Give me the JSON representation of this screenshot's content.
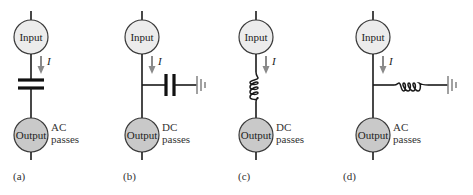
{
  "figure": {
    "panels": [
      {
        "id": "a",
        "label": "(a)",
        "input_label": "Input",
        "output_label": "Output",
        "current_label": "I",
        "pass_line1": "AC",
        "pass_line2": "passes",
        "component": "series-capacitor"
      },
      {
        "id": "b",
        "label": "(b)",
        "input_label": "Input",
        "output_label": "Output",
        "current_label": "I",
        "pass_line1": "DC",
        "pass_line2": "passes",
        "component": "shunt-capacitor-to-ground"
      },
      {
        "id": "c",
        "label": "(c)",
        "input_label": "Input",
        "output_label": "Output",
        "current_label": "I",
        "pass_line1": "DC",
        "pass_line2": "passes",
        "component": "series-inductor"
      },
      {
        "id": "d",
        "label": "(d)",
        "input_label": "Input",
        "output_label": "Output",
        "current_label": "I",
        "pass_line1": "AC",
        "pass_line2": "passes",
        "component": "shunt-inductor-to-ground"
      }
    ],
    "icons": {
      "capacitor": "capacitor-icon",
      "inductor": "inductor-icon",
      "ground": "ground-icon",
      "current-arrow": "arrow-down-icon"
    },
    "colors": {
      "input_fill": "#ececec",
      "output_fill": "#c9c9c9",
      "wire": "#1a1a1a",
      "arrow": "#8a8a8a",
      "ground": "#8a8a8a"
    }
  }
}
